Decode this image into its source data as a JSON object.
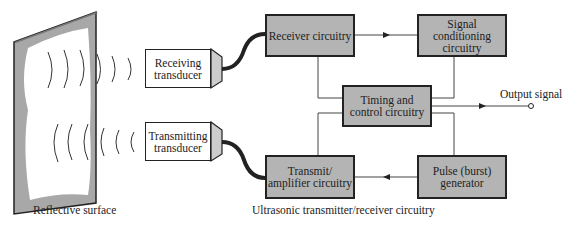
{
  "diagram": {
    "surface_label": "Reflective surface",
    "system_label": "Ultrasonic transmitter/receiver circuitry",
    "output_label": "Output signal",
    "transducers": {
      "receiving": "Receiving transducer",
      "transmitting": "Transmitting transducer"
    },
    "blocks": {
      "receiver": "Receiver circuitry",
      "signal_conditioning": "Signal conditioning circuitry",
      "timing": "Timing and control circuitry",
      "transmit": "Transmit/ amplifier circuitry",
      "pulse": "Pulse (burst) generator"
    },
    "colors": {
      "block_fill": "#b4b4b4",
      "line": "#222222",
      "surface_shade": "#a8a8a8"
    }
  }
}
